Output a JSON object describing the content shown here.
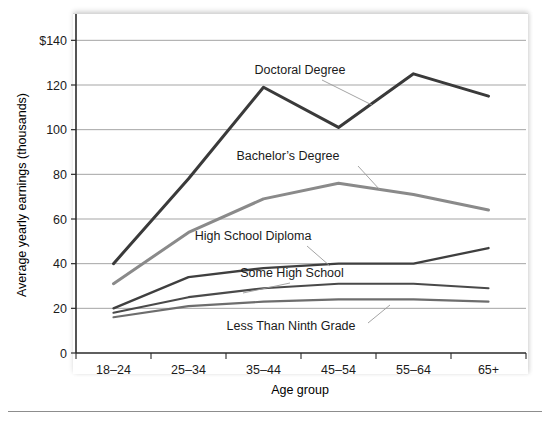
{
  "chart_data": {
    "type": "line",
    "title": "",
    "xlabel": "Age group",
    "ylabel": "Average yearly earnings (thousands)",
    "categories": [
      "18–24",
      "25–34",
      "35–44",
      "45–54",
      "55–64",
      "65+"
    ],
    "ytick_labels": [
      "0",
      "20",
      "40",
      "60",
      "80",
      "100",
      "120",
      "$140"
    ],
    "ytick_values": [
      0,
      20,
      40,
      60,
      80,
      100,
      120,
      140
    ],
    "ylim": [
      0,
      150
    ],
    "grid": "horizontal",
    "legend": "inline-labels",
    "series": [
      {
        "name": "Doctoral Degree",
        "color": "#3a3a3a",
        "width": 3.0,
        "values": [
          40,
          78,
          119,
          101,
          125,
          115
        ],
        "label_x": 300,
        "label_y": 74,
        "leader": [
          [
            322,
            80
          ],
          [
            372,
            105
          ]
        ]
      },
      {
        "name": "Bachelor’s Degree",
        "color": "#8a8a8a",
        "width": 3.0,
        "values": [
          31,
          54,
          69,
          76,
          71,
          64
        ],
        "label_x": 288,
        "label_y": 160,
        "leader": [
          [
            358,
            166
          ],
          [
            380,
            190
          ]
        ]
      },
      {
        "name": "High School Diploma",
        "color": "#3f3f3f",
        "width": 2.3,
        "values": [
          20,
          34,
          38,
          40,
          40,
          47
        ],
        "label_x": 253,
        "label_y": 240,
        "leader": [
          [
            307,
            246
          ],
          [
            330,
            266
          ]
        ]
      },
      {
        "name": "Some High School",
        "color": "#4a4a4a",
        "width": 2.1,
        "values": [
          18,
          25,
          29,
          31,
          31,
          29
        ],
        "label_x": 292,
        "label_y": 277,
        "leader": [
          [
            290,
            283
          ],
          [
            243,
            293
          ]
        ]
      },
      {
        "name": "Less Than Ninth Grade",
        "color": "#6d6d6d",
        "width": 2.1,
        "values": [
          16,
          21,
          23,
          24,
          24,
          23
        ],
        "label_x": 291,
        "label_y": 330,
        "leader": [
          [
            368,
            323
          ],
          [
            390,
            305
          ]
        ]
      }
    ]
  }
}
